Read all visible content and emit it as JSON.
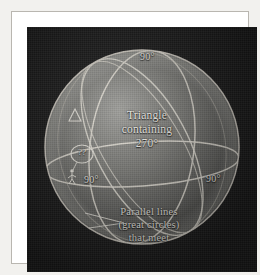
{
  "figure": {
    "plate": {
      "background_color": "#1a1a1a",
      "sphere_color": "#6f6f6f",
      "line_color": "#e8e6df",
      "text_color": "#f4f2ec"
    },
    "labels": {
      "triangle_caption": "Triangle containing 270°",
      "triangle_caption_line1": "Triangle",
      "triangle_caption_line2": "containing",
      "triangle_caption_line3": "270°",
      "parallel_caption": "Parallel lines (great circles) that meet",
      "parallel_caption_line1": "Parallel lines",
      "parallel_caption_line2": "(great circles)",
      "parallel_caption_line3": "that meet",
      "angle_top": "90°",
      "angle_left": "90°",
      "angle_right": "90°",
      "thought_bubble": "??"
    },
    "annotations": {
      "triangle_marker": "delta-triangle-marker",
      "observer_figure": "standing-person-figure",
      "thought_bubble_icon": "thought-bubble-icon",
      "pointer_leader": "pointer-leader-line"
    },
    "geometry": {
      "sphere_center_x": 115,
      "sphere_center_y": 120,
      "sphere_radius": 97,
      "equator_tilt_deg": 9,
      "meridian_count": 3,
      "angles_sum_degrees": 270
    }
  }
}
